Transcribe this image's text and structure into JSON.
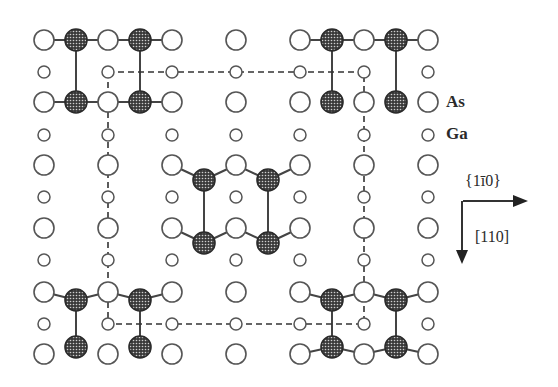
{
  "figure": {
    "legend": [
      {
        "label": "As",
        "x": 446,
        "y": 92
      },
      {
        "label": "Ga",
        "x": 446,
        "y": 124
      }
    ],
    "directions": {
      "horizontal": {
        "label": "{1̅0}",
        "display": "{1ī0}"
      },
      "vertical": {
        "label": "[110]"
      }
    }
  },
  "lattice": {
    "columns": [
      44,
      108,
      172,
      236,
      300,
      364,
      428
    ],
    "as_rows": [
      40,
      102,
      165,
      228,
      292,
      354
    ],
    "ga_rows": [
      72,
      135,
      197,
      260,
      324
    ],
    "as_radius": 10,
    "ga_radius": 6,
    "colors": {
      "stroke": "#555555",
      "fill": "#ffffff",
      "dimer": "#3a3a3a",
      "bond": "#444444",
      "dash": "#333333"
    }
  },
  "unit_cell": {
    "x1": 108,
    "y1": 72,
    "x2": 364,
    "y2": 324
  },
  "dimer_groups": [
    {
      "name": "top-left",
      "atoms": [
        [
          76,
          40
        ],
        [
          140,
          40
        ],
        [
          76,
          102
        ],
        [
          140,
          102
        ]
      ],
      "bonds": [
        [
          [
            44,
            40
          ],
          [
            76,
            40
          ]
        ],
        [
          [
            76,
            40
          ],
          [
            108,
            40
          ]
        ],
        [
          [
            108,
            40
          ],
          [
            140,
            40
          ]
        ],
        [
          [
            140,
            40
          ],
          [
            172,
            40
          ]
        ],
        [
          [
            76,
            40
          ],
          [
            76,
            102
          ]
        ],
        [
          [
            140,
            40
          ],
          [
            140,
            102
          ]
        ],
        [
          [
            44,
            102
          ],
          [
            76,
            102
          ]
        ],
        [
          [
            76,
            102
          ],
          [
            108,
            102
          ]
        ],
        [
          [
            108,
            102
          ],
          [
            140,
            102
          ]
        ],
        [
          [
            140,
            102
          ],
          [
            172,
            102
          ]
        ]
      ],
      "hide_as": [
        [
          76,
          40
        ],
        [
          140,
          40
        ],
        [
          76,
          102
        ],
        [
          140,
          102
        ]
      ]
    },
    {
      "name": "top-right",
      "atoms": [
        [
          332,
          40
        ],
        [
          396,
          40
        ],
        [
          332,
          102
        ],
        [
          396,
          102
        ]
      ],
      "bonds": [
        [
          [
            300,
            40
          ],
          [
            332,
            40
          ]
        ],
        [
          [
            332,
            40
          ],
          [
            364,
            40
          ]
        ],
        [
          [
            364,
            40
          ],
          [
            396,
            40
          ]
        ],
        [
          [
            396,
            40
          ],
          [
            428,
            40
          ]
        ],
        [
          [
            332,
            40
          ],
          [
            332,
            102
          ]
        ],
        [
          [
            396,
            40
          ],
          [
            396,
            102
          ]
        ]
      ]
    },
    {
      "name": "center",
      "atoms": [
        [
          204,
          180
        ],
        [
          268,
          180
        ],
        [
          204,
          243
        ],
        [
          268,
          243
        ]
      ],
      "bonds": [
        [
          [
            172,
            165
          ],
          [
            204,
            180
          ]
        ],
        [
          [
            204,
            180
          ],
          [
            236,
            165
          ]
        ],
        [
          [
            236,
            165
          ],
          [
            268,
            180
          ]
        ],
        [
          [
            268,
            180
          ],
          [
            300,
            165
          ]
        ],
        [
          [
            204,
            180
          ],
          [
            204,
            243
          ]
        ],
        [
          [
            268,
            180
          ],
          [
            268,
            243
          ]
        ],
        [
          [
            172,
            228
          ],
          [
            204,
            243
          ]
        ],
        [
          [
            204,
            243
          ],
          [
            236,
            228
          ]
        ],
        [
          [
            236,
            228
          ],
          [
            268,
            243
          ]
        ],
        [
          [
            268,
            243
          ],
          [
            300,
            228
          ]
        ]
      ]
    },
    {
      "name": "bottom-left",
      "atoms": [
        [
          76,
          300
        ],
        [
          140,
          300
        ],
        [
          76,
          347
        ],
        [
          140,
          347
        ]
      ],
      "bonds": [
        [
          [
            44,
            292
          ],
          [
            76,
            300
          ]
        ],
        [
          [
            76,
            300
          ],
          [
            108,
            292
          ]
        ],
        [
          [
            108,
            292
          ],
          [
            140,
            300
          ]
        ],
        [
          [
            140,
            300
          ],
          [
            172,
            292
          ]
        ],
        [
          [
            76,
            300
          ],
          [
            76,
            347
          ]
        ],
        [
          [
            140,
            300
          ],
          [
            140,
            347
          ]
        ]
      ]
    },
    {
      "name": "bottom-right",
      "atoms": [
        [
          332,
          300
        ],
        [
          396,
          300
        ],
        [
          332,
          347
        ],
        [
          396,
          347
        ]
      ],
      "bonds": [
        [
          [
            300,
            292
          ],
          [
            332,
            300
          ]
        ],
        [
          [
            332,
            300
          ],
          [
            364,
            292
          ]
        ],
        [
          [
            364,
            292
          ],
          [
            396,
            300
          ]
        ],
        [
          [
            396,
            300
          ],
          [
            428,
            292
          ]
        ],
        [
          [
            332,
            300
          ],
          [
            332,
            347
          ]
        ],
        [
          [
            396,
            300
          ],
          [
            396,
            347
          ]
        ],
        [
          [
            300,
            354
          ],
          [
            332,
            347
          ]
        ],
        [
          [
            332,
            347
          ],
          [
            364,
            354
          ]
        ],
        [
          [
            364,
            354
          ],
          [
            396,
            347
          ]
        ],
        [
          [
            396,
            347
          ],
          [
            428,
            354
          ]
        ]
      ]
    }
  ]
}
